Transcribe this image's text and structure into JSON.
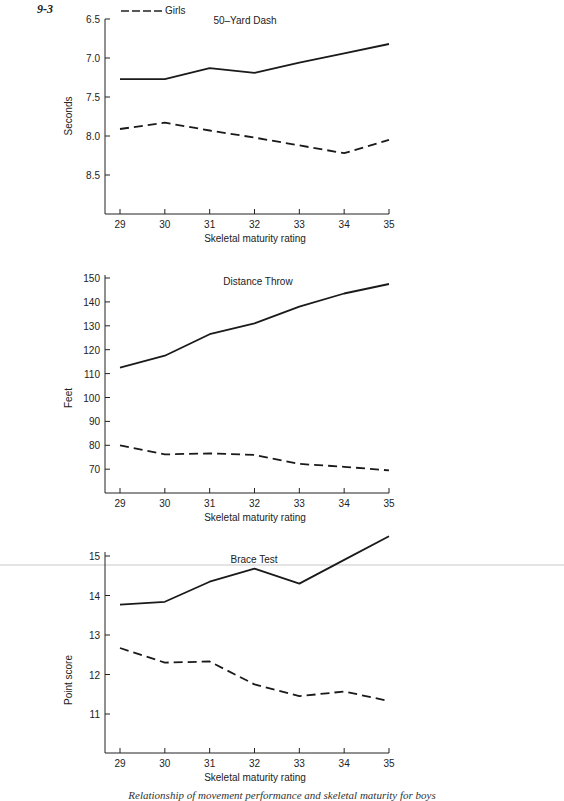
{
  "figure_number": "9-3",
  "legend": [
    {
      "label": "Girls",
      "style": "dashed"
    }
  ],
  "caption": "Relationship of movement performance and skeletal maturity for boys",
  "chart_data": [
    {
      "type": "line",
      "title": "50–Yard Dash",
      "xlabel": "Skeletal maturity rating",
      "ylabel": "Seconds",
      "x": [
        29,
        30,
        31,
        32,
        33,
        34,
        35
      ],
      "yticks": [
        "6.5",
        "7.0",
        "7.5",
        "8.0",
        "8.5"
      ],
      "ylim": [
        6.5,
        9.0
      ],
      "y_inverted": true,
      "series": [
        {
          "name": "Boys",
          "style": "solid",
          "values": [
            7.27,
            7.27,
            7.13,
            7.19,
            7.06,
            6.94,
            6.82
          ]
        },
        {
          "name": "Girls",
          "style": "dashed",
          "values": [
            7.91,
            7.83,
            7.93,
            8.02,
            8.12,
            8.22,
            8.05
          ]
        }
      ]
    },
    {
      "type": "line",
      "title": "Distance Throw",
      "xlabel": "Skeletal maturity rating",
      "ylabel": "Feet",
      "x": [
        29,
        30,
        31,
        32,
        33,
        34,
        35
      ],
      "yticks": [
        "150",
        "140",
        "130",
        "120",
        "110",
        "100",
        "90",
        "80",
        "70"
      ],
      "ylim": [
        61,
        150
      ],
      "series": [
        {
          "name": "Boys",
          "style": "solid",
          "values": [
            112.5,
            117.5,
            126.5,
            131,
            138,
            143.5,
            147.5
          ]
        },
        {
          "name": "Girls",
          "style": "dashed",
          "values": [
            80,
            76.2,
            76.6,
            76,
            72.2,
            71,
            69.5
          ]
        }
      ]
    },
    {
      "type": "line",
      "title": "Brace Test",
      "xlabel": "Skeletal maturity rating",
      "ylabel": "Point score",
      "x": [
        29,
        30,
        31,
        32,
        33,
        34,
        35
      ],
      "yticks": [
        "15",
        "14",
        "13",
        "12",
        "11"
      ],
      "ylim": [
        10,
        15.5
      ],
      "series": [
        {
          "name": "Boys",
          "style": "solid",
          "values": [
            13.77,
            13.84,
            14.35,
            14.68,
            14.3,
            14.9,
            15.5
          ]
        },
        {
          "name": "Girls",
          "style": "dashed",
          "values": [
            12.67,
            12.3,
            12.33,
            11.75,
            11.45,
            11.57,
            11.33
          ]
        }
      ]
    }
  ]
}
